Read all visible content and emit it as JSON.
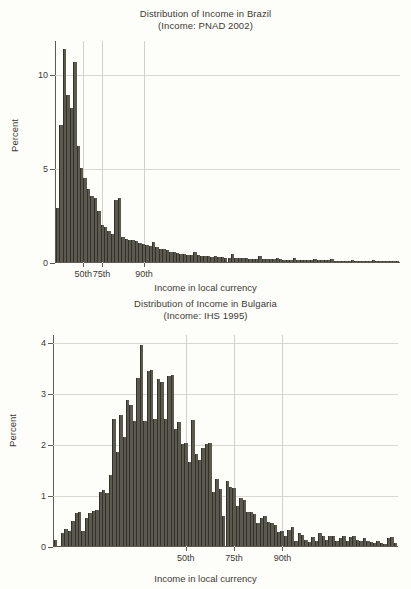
{
  "charts": [
    {
      "id": "brazil",
      "title_line1": "Distribution of Income in Brazil",
      "title_line2": "(Income: PNAD 2002)",
      "xlabel": "Income in local currency",
      "ylabel": "Percent",
      "bar_color": "#5c594f",
      "chart_data": {
        "type": "bar",
        "title": "Distribution of Income in Brazil (Income: PNAD 2002)",
        "xlabel": "Income in local currency",
        "ylabel": "Percent",
        "ylim": [
          0,
          11.8
        ],
        "yticks": [
          0,
          5,
          10
        ],
        "ytick_labels": [
          "0",
          "5",
          "10"
        ],
        "grid": true,
        "legend": "none",
        "percentile_markers": [
          {
            "label": "50th",
            "x_frac": 0.082
          },
          {
            "label": "75th",
            "x_frac": 0.135
          },
          {
            "label": "90th",
            "x_frac": 0.258
          }
        ],
        "n_bins": 100,
        "values": [
          2.9,
          7.3,
          11.4,
          8.9,
          8.2,
          10.7,
          6.2,
          5.0,
          4.5,
          3.9,
          3.5,
          3.4,
          2.7,
          2.0,
          1.85,
          1.65,
          1.5,
          3.3,
          3.4,
          1.35,
          1.25,
          1.2,
          1.15,
          1.1,
          1.0,
          0.95,
          0.9,
          0.85,
          1.05,
          0.8,
          0.72,
          0.68,
          0.62,
          0.55,
          0.52,
          0.5,
          0.45,
          0.42,
          0.4,
          0.38,
          0.55,
          0.35,
          0.33,
          0.3,
          0.3,
          0.28,
          0.3,
          0.26,
          0.25,
          0.24,
          0.23,
          0.45,
          0.22,
          0.2,
          0.2,
          0.19,
          0.18,
          0.18,
          0.17,
          0.3,
          0.16,
          0.16,
          0.15,
          0.14,
          0.22,
          0.14,
          0.13,
          0.13,
          0.12,
          0.2,
          0.12,
          0.11,
          0.11,
          0.1,
          0.1,
          0.18,
          0.1,
          0.09,
          0.09,
          0.09,
          0.14,
          0.08,
          0.08,
          0.08,
          0.07,
          0.07,
          0.12,
          0.07,
          0.06,
          0.06,
          0.06,
          0.05,
          0.1,
          0.05,
          0.05,
          0.04,
          0.04,
          0.04,
          0.03,
          0.03
        ]
      }
    },
    {
      "id": "bulgaria",
      "title_line1": "Distribution of Income in Bulgaria",
      "title_line2": "(Income: IHS 1995)",
      "xlabel": "Income in local currency",
      "ylabel": "Percent",
      "bar_color": "#5c594f",
      "chart_data": {
        "type": "bar",
        "title": "Distribution of Income in Bulgaria (Income: IHS 1995)",
        "xlabel": "Income in local currency",
        "ylabel": "Percent",
        "ylim": [
          0,
          4.15
        ],
        "yticks": [
          0,
          1,
          2,
          3,
          4
        ],
        "ytick_labels": [
          "0",
          "1",
          "2",
          "3",
          "4"
        ],
        "grid": true,
        "legend": "none",
        "percentile_markers": [
          {
            "label": "50th",
            "x_frac": 0.385
          },
          {
            "label": "75th",
            "x_frac": 0.525
          },
          {
            "label": "90th",
            "x_frac": 0.665
          }
        ],
        "n_bins": 100,
        "values": [
          0.12,
          0.0,
          0.25,
          0.33,
          0.3,
          0.5,
          0.65,
          0.67,
          0.3,
          0.55,
          0.65,
          0.68,
          0.7,
          1.07,
          1.1,
          1.05,
          1.4,
          2.5,
          1.85,
          2.58,
          2.15,
          2.87,
          2.77,
          2.45,
          3.3,
          3.95,
          2.45,
          3.45,
          3.47,
          2.5,
          3.28,
          3.22,
          2.5,
          3.35,
          3.37,
          2.3,
          2.43,
          2.0,
          2.02,
          1.65,
          2.47,
          1.8,
          1.7,
          1.92,
          2.0,
          2.02,
          1.07,
          1.32,
          1.12,
          0.6,
          1.28,
          1.17,
          1.15,
          0.78,
          0.95,
          0.9,
          0.67,
          0.67,
          0.62,
          0.45,
          0.55,
          0.6,
          0.47,
          0.45,
          0.42,
          0.28,
          0.3,
          0.2,
          0.32,
          0.38,
          0.1,
          0.25,
          0.22,
          0.12,
          0.07,
          0.18,
          0.1,
          0.25,
          0.2,
          0.12,
          0.2,
          0.2,
          0.1,
          0.15,
          0.2,
          0.1,
          0.18,
          0.2,
          0.12,
          0.1,
          0.15,
          0.1,
          0.08,
          0.05,
          0.1,
          0.06,
          0.04,
          0.15,
          0.18,
          0.05
        ]
      }
    }
  ]
}
